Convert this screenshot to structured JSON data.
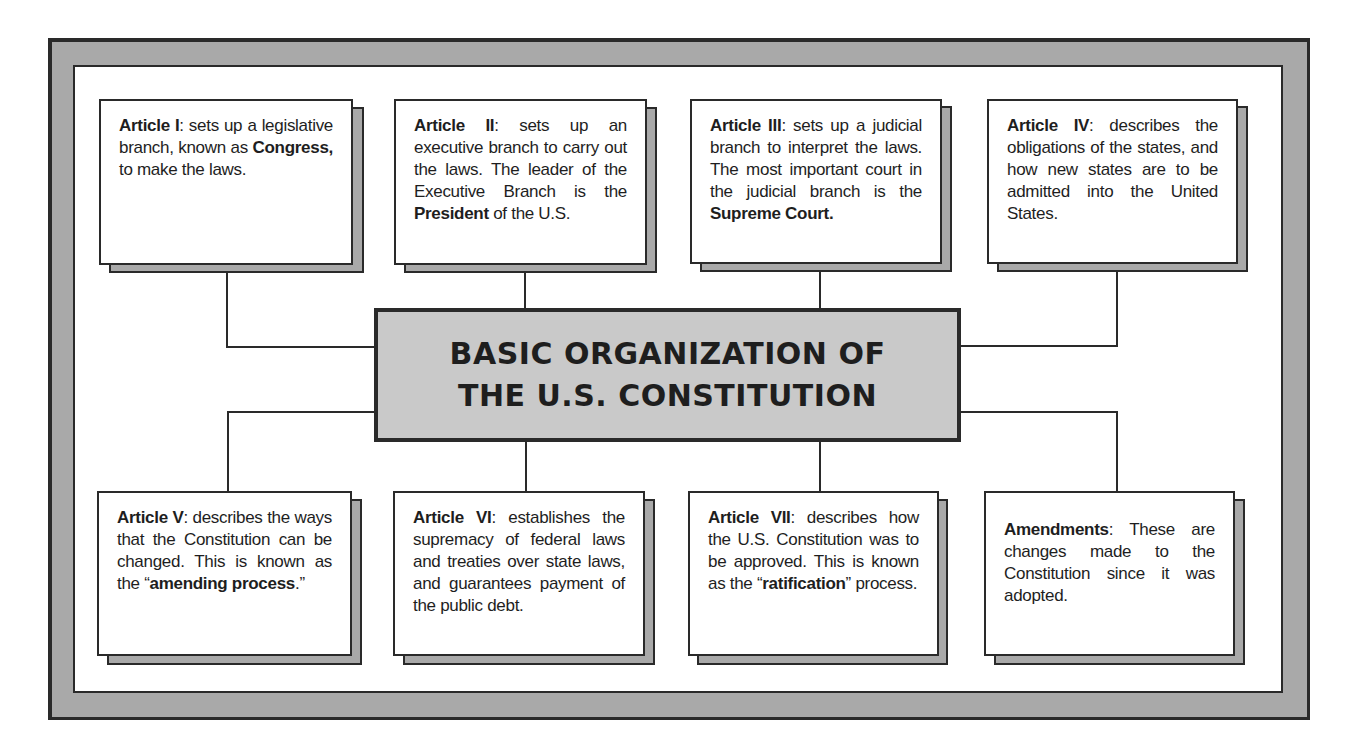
{
  "title": {
    "line1": "BASIC ORGANIZATION OF",
    "line2": "THE U.S. CONSTITUTION"
  },
  "colors": {
    "frame_gray": "#a9a9a9",
    "center_fill": "#c9c9c9",
    "ink": "#2a2a2a",
    "panel": "#ffffff"
  },
  "boxes": [
    {
      "id": "article-1",
      "parts": [
        {
          "b": "Article I"
        },
        {
          "t": ": sets up a legislative branch, known as "
        },
        {
          "b": "Congress,"
        },
        {
          "t": " to make the laws."
        }
      ]
    },
    {
      "id": "article-2",
      "parts": [
        {
          "b": "Article II"
        },
        {
          "t": ": sets up an executive branch to carry out the laws. The leader of the Executive Branch is the "
        },
        {
          "b": "President"
        },
        {
          "t": " of the U.S."
        }
      ]
    },
    {
      "id": "article-3",
      "parts": [
        {
          "b": "Article III"
        },
        {
          "t": ": sets up a judicial branch to interpret the laws. The most important court in the judicial branch is the "
        },
        {
          "b": "Supreme Court."
        }
      ]
    },
    {
      "id": "article-4",
      "parts": [
        {
          "b": "Article IV"
        },
        {
          "t": ": describes the obligations of the states, and how new states are to be admitted into the United States."
        }
      ]
    },
    {
      "id": "article-5",
      "parts": [
        {
          "b": "Article V"
        },
        {
          "t": ": describes the ways that the Constitution can be changed. This is known as the “"
        },
        {
          "b": "amending process"
        },
        {
          "t": ".”"
        }
      ]
    },
    {
      "id": "article-6",
      "parts": [
        {
          "b": "Article VI"
        },
        {
          "t": ": establishes the supremacy of federal laws and treaties over state laws, and guarantees payment of the public debt."
        }
      ]
    },
    {
      "id": "article-7",
      "parts": [
        {
          "b": "Article VII"
        },
        {
          "t": ": describes how the U.S. Constitution was to be approved. This is known as the “"
        },
        {
          "b": "ratification"
        },
        {
          "t": "” process."
        }
      ]
    },
    {
      "id": "amendments",
      "parts": [
        {
          "b": "Amendments"
        },
        {
          "t": ": These are changes made to the Constitution since it was adopted."
        }
      ]
    }
  ]
}
